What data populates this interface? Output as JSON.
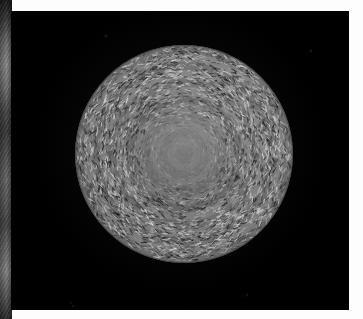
{
  "figure": {
    "caption": "",
    "medium": "photographic plate",
    "subject_label": "textured sphere",
    "background_color": "#000000",
    "page_color": "#fdfdfd"
  },
  "plate": {
    "name": "photo-plate",
    "x": 11,
    "y": 11,
    "width": 338,
    "height": 299,
    "fill": "#000000"
  },
  "neighbor_strip": {
    "name": "adjacent-photo-sliver",
    "x": 0,
    "y": 0,
    "width": 12,
    "height": 319,
    "description": "vertical grayscale sliver of an adjoining photograph",
    "tone_range": [
      "#1b1b1b",
      "#8d8d8d"
    ]
  },
  "sphere": {
    "name": "textured-sphere",
    "center_x": 184,
    "center_y": 153,
    "radius": 109,
    "diameter": 218,
    "surface": "dense fibrous granular texture in concentric swirl bands",
    "core": {
      "description": "smooth low-contrast lighter core",
      "radius": 43
    },
    "tones": {
      "darkest": "#141414",
      "mid": "#6b6b6b",
      "brightest": "#d6d6d6",
      "core": "#8e8e8e"
    },
    "highlight_direction": "upper-right"
  },
  "texture": {
    "fiber_count": 5200,
    "ring_count": 13,
    "mode": "tangential striations",
    "seed": 20240517
  }
}
